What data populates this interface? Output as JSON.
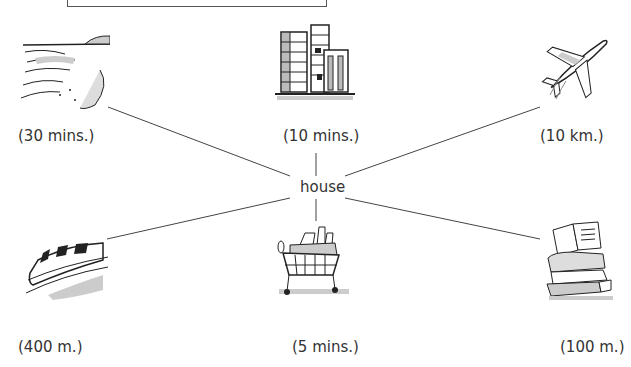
{
  "center": {
    "label": "house",
    "icon": "house-node"
  },
  "places": [
    {
      "id": "beach",
      "icon": "beach-icon",
      "distance": "(30 mins.)"
    },
    {
      "id": "city",
      "icon": "city-buildings-icon",
      "distance": "(10 mins.)"
    },
    {
      "id": "airport",
      "icon": "airplane-icon",
      "distance": "(10 km.)"
    },
    {
      "id": "station",
      "icon": "train-icon",
      "distance": "(400 m.)"
    },
    {
      "id": "supermarket",
      "icon": "shopping-cart-icon",
      "distance": "(5 mins.)"
    },
    {
      "id": "library",
      "icon": "books-icon",
      "distance": "(100 m.)"
    }
  ],
  "colors": {
    "line": "#444444",
    "text": "#333333",
    "shade": "#bbbbbb"
  }
}
